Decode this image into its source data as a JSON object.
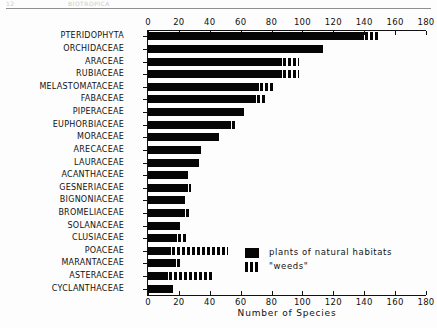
{
  "scan": {
    "header_left": "12",
    "header_mid": "BIOTROPICA"
  },
  "legend": {
    "items": [
      {
        "label": "plants of natural habitats",
        "swatch": "solid",
        "color": "#050505"
      },
      {
        "label": "\"weeds\"",
        "swatch": "hatched",
        "color": "#050505"
      }
    ]
  },
  "chart_data": {
    "type": "bar",
    "orientation": "horizontal",
    "stacked": true,
    "title": "",
    "xlabel": "Number of Species",
    "ylabel": "",
    "xlim": [
      0,
      180
    ],
    "xticks": [
      0,
      20,
      40,
      60,
      80,
      100,
      120,
      140,
      160,
      180
    ],
    "xtick_labels": [
      "0",
      "20",
      "40",
      "60",
      "80",
      "100",
      "120",
      "140",
      "160",
      "180"
    ],
    "grid": false,
    "axis_top": true,
    "axis_bottom": true,
    "legend_position": "inside-right-lower",
    "categories": [
      "PTERIDOPHYTA",
      "ORCHIDACEAE",
      "ARACEAE",
      "RUBIACEAE",
      "MELASTOMATACEAE",
      "FABACEAE",
      "PIPERACEAE",
      "EUPHORBIACEAE",
      "MORACEAE",
      "ARECACEAE",
      "LAURACEAE",
      "ACANTHACEAE",
      "GESNERIACEAE",
      "BIGNONIACEAE",
      "BROMELIACEAE",
      "SOLANACEAE",
      "CLUSIACEAE",
      "POACEAE",
      "MARANTACEAE",
      "ASTERACEAE",
      "CYCLANTHACEAE"
    ],
    "series": [
      {
        "name": "plants of natural habitats",
        "color": "#050505",
        "pattern": "solid",
        "values": [
          140,
          113,
          87,
          87,
          72,
          70,
          62,
          54,
          46,
          34,
          33,
          26,
          26,
          24,
          24,
          21,
          19,
          15,
          18,
          13,
          16
        ]
      },
      {
        "name": "\"weeds\"",
        "color": "#050505",
        "pattern": "hatched",
        "values": [
          8,
          0,
          10,
          10,
          8,
          5,
          0,
          3,
          0,
          0,
          0,
          0,
          1,
          0,
          2,
          0,
          6,
          36,
          2,
          29,
          0
        ]
      }
    ],
    "totals": [
      148,
      113,
      97,
      97,
      80,
      75,
      62,
      57,
      46,
      34,
      33,
      26,
      27,
      24,
      26,
      21,
      25,
      51,
      20,
      42,
      16
    ]
  }
}
